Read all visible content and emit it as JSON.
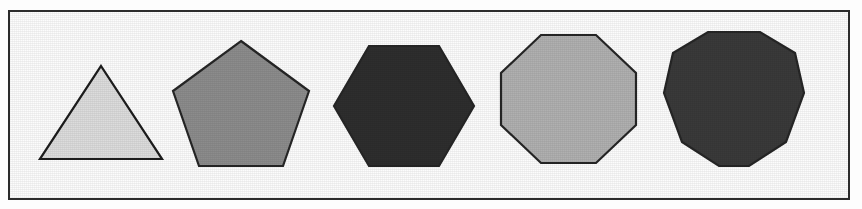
{
  "figure": {
    "background_color": "#fdfdfd",
    "plate_background_color": "#fcfcfc",
    "frame": {
      "border_color": "#2b2b2b",
      "border_width_px": 2,
      "x": 8,
      "y": 10,
      "width": 842,
      "height": 190
    },
    "shape_count": 5,
    "outline_color": "#262626",
    "outline_width_px": 2
  },
  "shapes": [
    {
      "name": "triangle",
      "label": "Triangle",
      "sides": 3,
      "fill_color": "#dcdcdc",
      "tone": "very light gray",
      "orientation": "point-up",
      "x": 44,
      "y": 70,
      "width": 122,
      "height": 93,
      "center_x": 105,
      "center_y": 130,
      "points": "61,0 122,93 0,93"
    },
    {
      "name": "pentagon",
      "label": "Pentagon",
      "sides": 5,
      "fill_color": "#8c8c8c",
      "tone": "medium gray",
      "orientation": "point-up",
      "x": 177,
      "y": 45,
      "width": 136,
      "height": 125,
      "center_x": 245,
      "center_y": 115,
      "points": "68,0 136,50 110,125 26,125 0,50"
    },
    {
      "name": "hexagon",
      "label": "Hexagon",
      "sides": 6,
      "fill_color": "#2e2e2e",
      "tone": "very dark gray",
      "orientation": "flat-top",
      "x": 338,
      "y": 50,
      "width": 140,
      "height": 120,
      "center_x": 408,
      "center_y": 110,
      "points": "35,0 105,0 140,60 105,120 35,120 0,60"
    },
    {
      "name": "octagon",
      "label": "Octagon",
      "sides": 8,
      "fill_color": "#b0b0b0",
      "tone": "light gray",
      "orientation": "flat-top",
      "x": 505,
      "y": 39,
      "width": 135,
      "height": 128,
      "center_x": 572,
      "center_y": 103,
      "points": "40,0 95,0 135,38 135,90 95,128 40,128 0,90 0,38"
    },
    {
      "name": "decagon",
      "label": "Decagon",
      "sides": 10,
      "fill_color": "#3a3a3a",
      "tone": "dark gray",
      "orientation": "flat-top",
      "x": 668,
      "y": 36,
      "width": 140,
      "height": 134,
      "center_x": 738,
      "center_y": 103,
      "points": "44,0 96,0 131,21 140,61 122,110 85,134 55,134 18,110 0,61 9,21"
    }
  ]
}
